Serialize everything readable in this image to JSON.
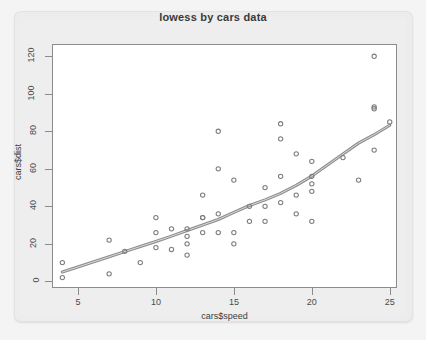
{
  "chart_data": {
    "type": "scatter",
    "title": "lowess by cars data",
    "xlabel": "cars$speed",
    "ylabel": "cars$dist",
    "xlim": [
      3.4,
      25.4
    ],
    "ylim": [
      -3,
      126
    ],
    "xticks": [
      5,
      10,
      15,
      20,
      25
    ],
    "yticks": [
      0,
      20,
      40,
      60,
      80,
      100,
      120
    ],
    "grid": false,
    "legend": null,
    "point_color": "#7d7d7d",
    "line_color": "#8e8e8e",
    "background": "#ffffff",
    "series": [
      {
        "name": "cars",
        "type": "scatter",
        "marker": "open-circle",
        "x": [
          4,
          4,
          7,
          7,
          8,
          9,
          10,
          10,
          10,
          11,
          11,
          12,
          12,
          12,
          12,
          13,
          13,
          13,
          13,
          14,
          14,
          14,
          14,
          15,
          15,
          15,
          16,
          16,
          17,
          17,
          17,
          18,
          18,
          18,
          18,
          19,
          19,
          19,
          20,
          20,
          20,
          20,
          20,
          22,
          23,
          24,
          24,
          24,
          24,
          25
        ],
        "y": [
          2,
          10,
          4,
          22,
          16,
          10,
          18,
          26,
          34,
          17,
          28,
          14,
          20,
          24,
          28,
          26,
          34,
          34,
          46,
          26,
          36,
          60,
          80,
          20,
          26,
          54,
          32,
          40,
          32,
          40,
          50,
          42,
          56,
          76,
          84,
          36,
          46,
          68,
          32,
          48,
          52,
          56,
          64,
          66,
          54,
          70,
          92,
          93,
          120,
          85
        ]
      },
      {
        "name": "lowess smoother",
        "type": "line",
        "x": [
          4,
          7,
          8,
          9,
          10,
          11,
          12,
          13,
          14,
          15,
          16,
          17,
          18,
          19,
          20,
          22,
          23,
          24,
          25
        ],
        "y": [
          4.965,
          13.124,
          15.858,
          18.579,
          21.28,
          24.129,
          27.119,
          30.027,
          32.963,
          36.757,
          40.435,
          43.463,
          46.885,
          51.196,
          56.11,
          67.923,
          73.697,
          78.186,
          83.243
        ]
      }
    ]
  },
  "axis": {
    "xtick_labels": [
      "5",
      "10",
      "15",
      "20",
      "25"
    ],
    "ytick_labels": [
      "0",
      "20",
      "40",
      "60",
      "80",
      "100",
      "120"
    ]
  }
}
